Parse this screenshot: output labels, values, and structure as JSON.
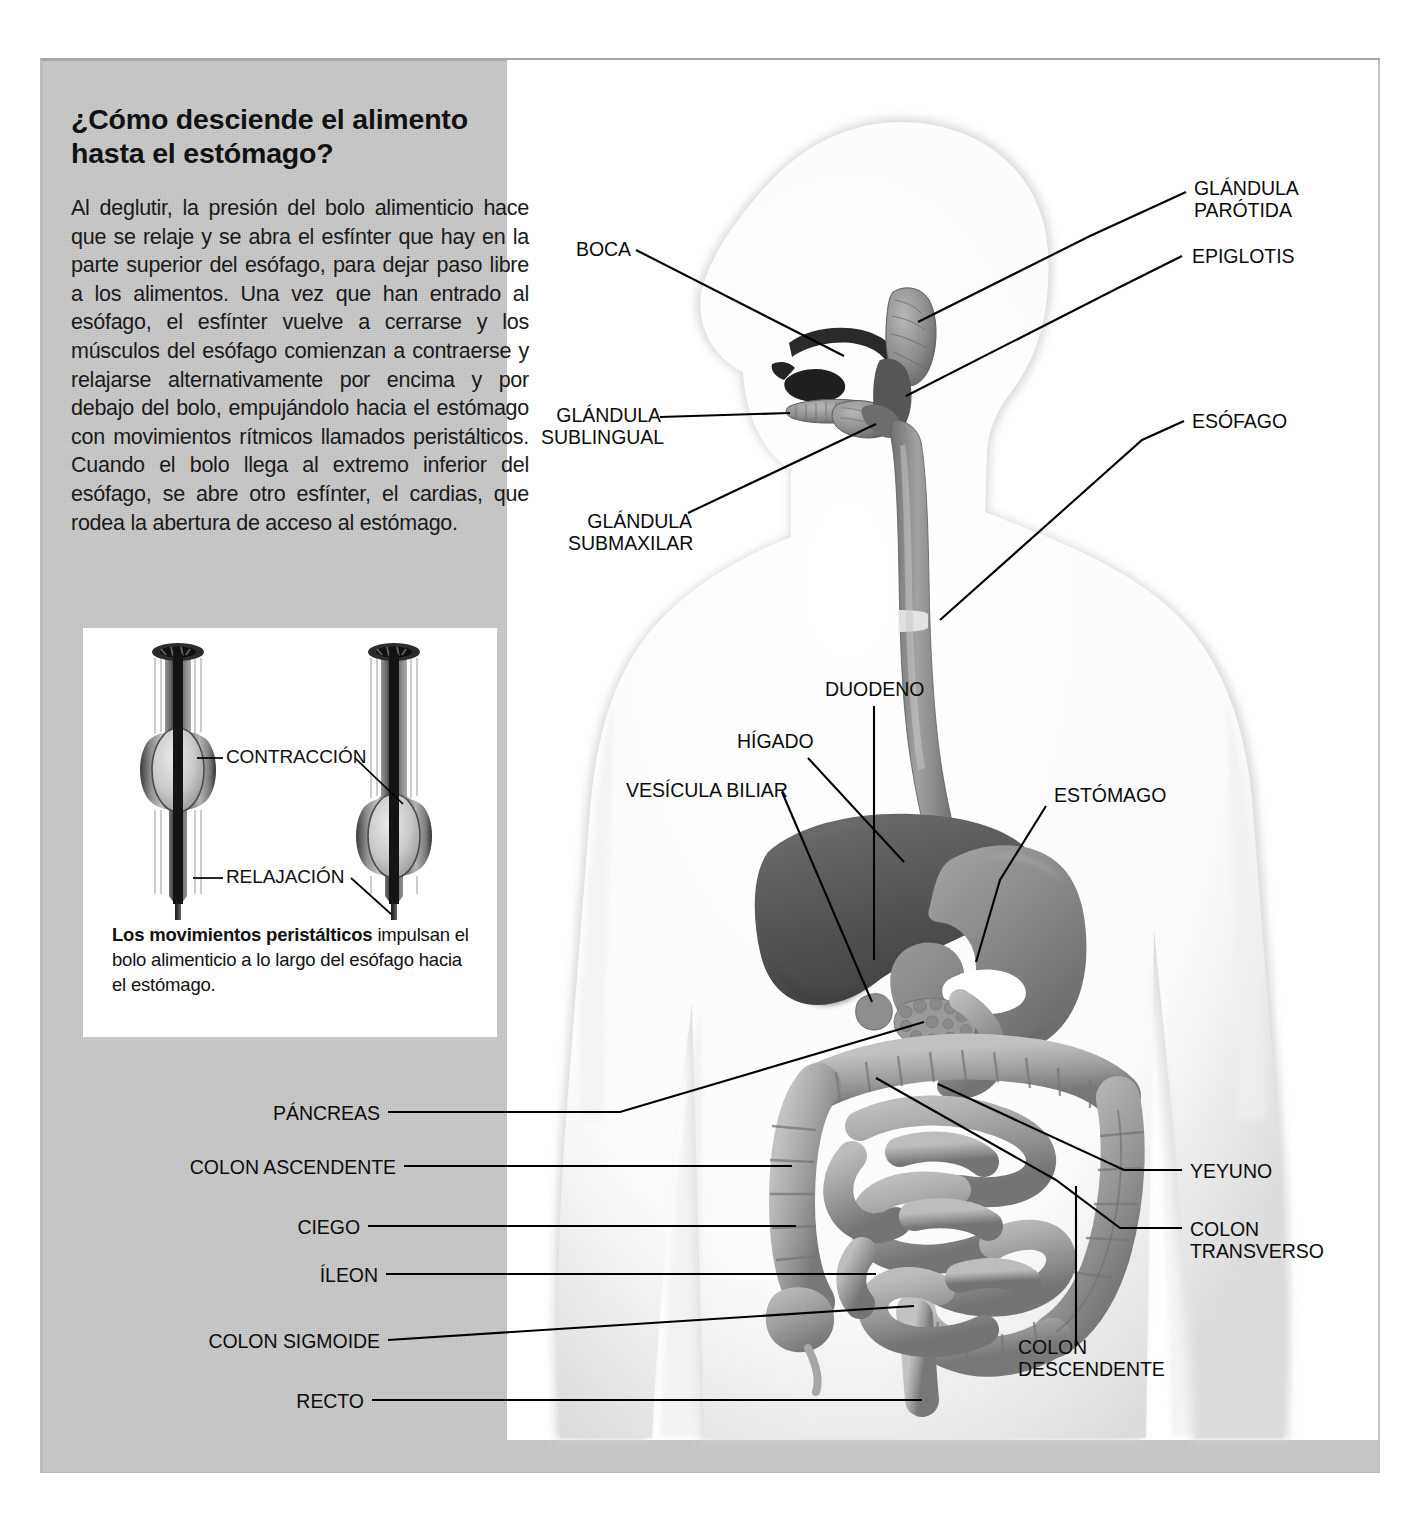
{
  "article": {
    "headline": "¿Cómo desciende el alimento hasta el estómago?",
    "body": "Al deglutir, la presión del bolo alimenticio hace que se relaje y se abra el esfínter que hay en la parte superior del esófago, para dejar paso libre a los alimentos. Una vez que han entrado al esófago, el esfínter vuelve a cerrarse y los músculos del esófago comienzan a contraerse y relajarse alternativamente por encima y por debajo del bolo, empujándolo hacia el estómago con movimientos rítmicos llamados peristálticos. Cuando el bolo llega al extremo inferior del esófago, se abre otro esfínter, el cardias, que rodea la abertura de acceso al estómago."
  },
  "inset": {
    "labels": [
      {
        "id": "contraccion",
        "text": "CONTRACCIÓN"
      },
      {
        "id": "relajacion",
        "text": "RELAJACIÓN"
      }
    ],
    "caption_bold": "Los movimientos peristálticos",
    "caption_rest": " impulsan el bolo alimenticio a lo largo del esófago hacia el estómago."
  },
  "diagram": {
    "labels": [
      {
        "id": "boca",
        "text": "BOCA"
      },
      {
        "id": "glandula-sublingual",
        "text": "GLÁNDULA\nSUBLINGUAL"
      },
      {
        "id": "glandula-submaxilar",
        "text": "GLÁNDULA\nSUBMAXILAR"
      },
      {
        "id": "glandula-parotida",
        "text": "GLÁNDULA\nPARÓTIDA"
      },
      {
        "id": "epiglotis",
        "text": "EPIGLOTIS"
      },
      {
        "id": "esofago",
        "text": "ESÓFAGO"
      },
      {
        "id": "duodeno",
        "text": "DUODENO"
      },
      {
        "id": "higado",
        "text": "HÍGADO"
      },
      {
        "id": "vesicula-biliar",
        "text": "VESÍCULA BILIAR"
      },
      {
        "id": "estomago",
        "text": "ESTÓMAGO"
      },
      {
        "id": "pancreas",
        "text": "PÁNCREAS"
      },
      {
        "id": "colon-ascendente",
        "text": "COLON ASCENDENTE"
      },
      {
        "id": "ciego",
        "text": "CIEGO"
      },
      {
        "id": "ileon",
        "text": "ÍLEON"
      },
      {
        "id": "colon-sigmoide",
        "text": "COLON SIGMOIDE"
      },
      {
        "id": "recto",
        "text": "RECTO"
      },
      {
        "id": "yeyuno",
        "text": "YEYUNO"
      },
      {
        "id": "colon-transverso",
        "text": "COLON\nTRANSVERSO"
      },
      {
        "id": "colon-descendente",
        "text": "COLON\nDESCENDENTE"
      }
    ]
  },
  "colors": {
    "panel_background": "#c9c9c9",
    "figure_background": "#ffffff",
    "text": "#111111",
    "leader_line": "#000000",
    "organ_dark": "#5e5e5e",
    "organ_mid": "#8a8a8a",
    "organ_light": "#b4b4b4"
  }
}
